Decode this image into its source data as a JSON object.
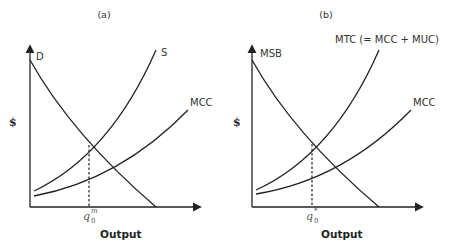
{
  "panels": [
    {
      "title": "(a)",
      "y_axis_label": "$",
      "x_axis_label": "Output",
      "curves": [
        {
          "label": "D",
          "type": "demand"
        },
        {
          "label": "S",
          "type": "supply"
        },
        {
          "label": "MCC",
          "type": "marginal-cost"
        }
      ],
      "equilibrium_label": {
        "base": "q",
        "subscript": "0",
        "superscript": "m"
      }
    },
    {
      "title": "(b)",
      "y_axis_label": "$",
      "x_axis_label": "Output",
      "curves": [
        {
          "label": "MSB",
          "type": "demand"
        },
        {
          "label": "MTC (= MCC + MUC)",
          "type": "supply"
        },
        {
          "label": "MCC",
          "type": "marginal-cost"
        }
      ],
      "equilibrium_label": {
        "base": "q",
        "subscript": "0",
        "superscript": "*"
      }
    }
  ]
}
